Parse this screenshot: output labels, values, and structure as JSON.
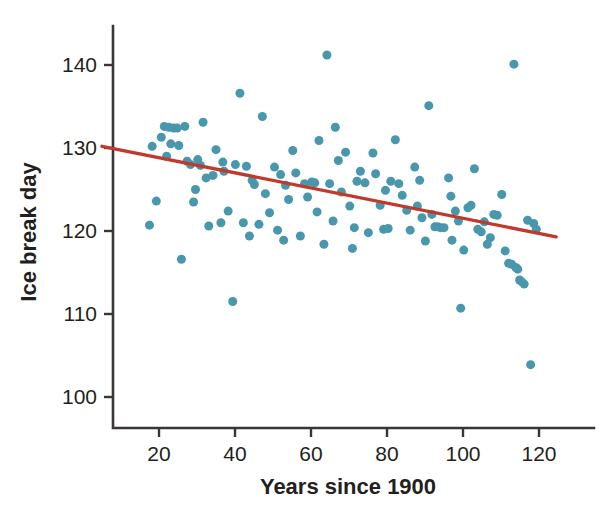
{
  "chart_data": {
    "type": "scatter",
    "title": "",
    "xlabel": "Years since 1900",
    "ylabel": "Ice break day",
    "xlim": [
      4,
      128
    ],
    "ylim": [
      97,
      144
    ],
    "xticks": [
      20,
      40,
      60,
      80,
      100,
      120
    ],
    "yticks": [
      100,
      110,
      120,
      130,
      140
    ],
    "xtick_labels": [
      "20",
      "40",
      "60",
      "80",
      "100",
      "120"
    ],
    "ytick_labels": [
      "100",
      "110",
      "120",
      "130",
      "140"
    ],
    "grid": false,
    "legend": false,
    "marker_color": "#4897ad",
    "marker_size": 9,
    "trend_line": {
      "label": "linear fit",
      "color": "#c0392b",
      "x_start": 5,
      "y_start": 130.2,
      "x_end": 124.5,
      "y_end": 119.3,
      "slope": -0.0912,
      "intercept": 130.66
    },
    "points": [
      [
        17.5,
        120.7
      ],
      [
        18.2,
        130.2
      ],
      [
        19.3,
        123.6
      ],
      [
        20.6,
        131.3
      ],
      [
        21.4,
        132.6
      ],
      [
        22.6,
        132.5
      ],
      [
        23.1,
        130.5
      ],
      [
        23.9,
        132.4
      ],
      [
        24.8,
        132.4
      ],
      [
        25.2,
        130.3
      ],
      [
        25.9,
        116.6
      ],
      [
        26.8,
        132.6
      ],
      [
        27.4,
        128.4
      ],
      [
        28.3,
        128.0
      ],
      [
        29.1,
        123.5
      ],
      [
        30.2,
        128.6
      ],
      [
        30.9,
        127.9
      ],
      [
        31.6,
        133.1
      ],
      [
        32.4,
        126.4
      ],
      [
        33.1,
        120.6
      ],
      [
        34.2,
        126.7
      ],
      [
        35.0,
        129.8
      ],
      [
        36.3,
        121.0
      ],
      [
        37.1,
        127.2
      ],
      [
        38.2,
        122.4
      ],
      [
        39.4,
        111.5
      ],
      [
        40.1,
        128.0
      ],
      [
        41.3,
        136.6
      ],
      [
        42.2,
        121.0
      ],
      [
        43.0,
        127.8
      ],
      [
        43.8,
        119.4
      ],
      [
        45.1,
        125.6
      ],
      [
        46.3,
        120.8
      ],
      [
        47.2,
        133.8
      ],
      [
        48.0,
        124.5
      ],
      [
        49.1,
        122.2
      ],
      [
        50.4,
        127.7
      ],
      [
        51.2,
        120.1
      ],
      [
        52.0,
        126.8
      ],
      [
        53.3,
        125.5
      ],
      [
        54.1,
        123.8
      ],
      [
        55.2,
        129.7
      ],
      [
        56.0,
        127.0
      ],
      [
        57.2,
        119.4
      ],
      [
        58.3,
        125.7
      ],
      [
        59.1,
        124.1
      ],
      [
        60.2,
        125.9
      ],
      [
        61.0,
        125.8
      ],
      [
        62.1,
        130.9
      ],
      [
        63.4,
        118.4
      ],
      [
        64.2,
        141.2
      ],
      [
        64.9,
        125.7
      ],
      [
        65.8,
        121.2
      ],
      [
        66.4,
        132.5
      ],
      [
        67.2,
        128.5
      ],
      [
        68.0,
        124.7
      ],
      [
        69.1,
        129.5
      ],
      [
        70.2,
        123.0
      ],
      [
        71.4,
        120.4
      ],
      [
        72.1,
        126.0
      ],
      [
        73.0,
        127.2
      ],
      [
        74.2,
        125.8
      ],
      [
        75.1,
        119.8
      ],
      [
        76.3,
        129.4
      ],
      [
        77.0,
        126.9
      ],
      [
        78.2,
        123.1
      ],
      [
        79.1,
        120.2
      ],
      [
        80.3,
        120.3
      ],
      [
        81.0,
        126.0
      ],
      [
        82.2,
        131.0
      ],
      [
        83.1,
        125.7
      ],
      [
        84.0,
        124.3
      ],
      [
        85.2,
        122.5
      ],
      [
        86.1,
        120.1
      ],
      [
        87.3,
        127.7
      ],
      [
        88.0,
        123.0
      ],
      [
        89.2,
        121.6
      ],
      [
        90.1,
        118.8
      ],
      [
        91.0,
        135.1
      ],
      [
        91.8,
        122.0
      ],
      [
        92.6,
        120.5
      ],
      [
        93.4,
        120.5
      ],
      [
        94.1,
        120.4
      ],
      [
        95.0,
        120.4
      ],
      [
        96.2,
        126.4
      ],
      [
        97.1,
        118.9
      ],
      [
        98.0,
        122.4
      ],
      [
        98.8,
        121.2
      ],
      [
        99.4,
        110.7
      ],
      [
        100.2,
        117.7
      ],
      [
        101.3,
        122.8
      ],
      [
        102.1,
        123.1
      ],
      [
        103.0,
        127.5
      ],
      [
        103.9,
        120.2
      ],
      [
        104.8,
        119.9
      ],
      [
        105.6,
        121.1
      ],
      [
        106.4,
        118.4
      ],
      [
        107.2,
        119.2
      ],
      [
        108.1,
        122.0
      ],
      [
        109.0,
        121.9
      ],
      [
        110.2,
        124.4
      ],
      [
        111.1,
        117.6
      ],
      [
        112.0,
        116.1
      ],
      [
        112.8,
        116.0
      ],
      [
        113.4,
        140.1
      ],
      [
        113.9,
        115.6
      ],
      [
        114.4,
        115.4
      ],
      [
        114.9,
        114.1
      ],
      [
        115.4,
        113.9
      ],
      [
        116.1,
        113.6
      ],
      [
        117.0,
        121.3
      ],
      [
        117.8,
        103.9
      ],
      [
        118.6,
        120.9
      ],
      [
        119.3,
        120.2
      ],
      [
        22.0,
        129.0
      ],
      [
        29.6,
        125.0
      ],
      [
        36.8,
        128.3
      ],
      [
        44.5,
        126.1
      ],
      [
        52.8,
        118.9
      ],
      [
        61.6,
        122.3
      ],
      [
        70.9,
        117.9
      ],
      [
        79.6,
        124.9
      ],
      [
        88.6,
        126.1
      ],
      [
        96.8,
        124.2
      ]
    ]
  }
}
